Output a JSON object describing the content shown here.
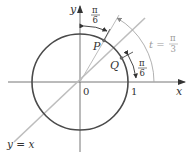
{
  "diagram": {
    "axes": {
      "x_label": "x",
      "y_label": "y",
      "origin_label": "0",
      "one_label": "1"
    },
    "points": [
      {
        "name": "P",
        "label": "P",
        "angle": "π/3"
      },
      {
        "name": "Q",
        "label": "Q",
        "angle": "π/6"
      }
    ],
    "line_label": "y = x",
    "angle_labels": {
      "top": {
        "num": "π",
        "den": "6"
      },
      "right": {
        "num": "π",
        "den": "6"
      },
      "t": {
        "prefix": "t =",
        "num": "π",
        "den": "3"
      }
    },
    "colors": {
      "circle": "#4a4a4a",
      "axes": "#555555",
      "line": "#b5b5b5",
      "label_gray": "#9a9a9a",
      "text": "#333333"
    }
  }
}
